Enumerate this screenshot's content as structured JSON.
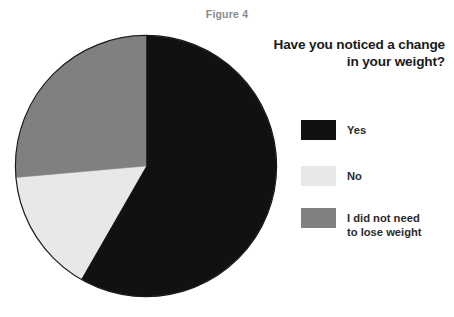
{
  "figure": {
    "caption": "Figure 4"
  },
  "heading": {
    "line1": "Have you noticed a change",
    "line2": "in your weight?"
  },
  "legend": {
    "items": [
      {
        "label": "Yes",
        "color": "#111111"
      },
      {
        "label": "No",
        "color": "#e8e8e8"
      },
      {
        "label": "I did not need\nto lose weight",
        "color": "#808080"
      }
    ]
  },
  "colors": {
    "background": "#ffffff",
    "caption": "#8a8a8a",
    "heading": "#1a1a1a",
    "legend_text": "#2b2b2b",
    "pie_outline": "#1a1a1a",
    "slice_yes": "#111111",
    "slice_no": "#e8e8e8",
    "slice_no_need": "#808080"
  },
  "chart_data": {
    "type": "pie",
    "title": "Have you noticed a change in your weight?",
    "subtitle": "Figure 4",
    "categories": [
      "Yes",
      "No",
      "I did not need to lose weight"
    ],
    "values": [
      58.3,
      15.3,
      26.4
    ],
    "unit": "percent",
    "colors": [
      "#111111",
      "#e8e8e8",
      "#808080"
    ],
    "start_angle_deg": 0,
    "direction": "clockwise",
    "slice_angles_deg": [
      210,
      55,
      95
    ],
    "boundaries_deg": [
      0,
      210,
      265,
      360
    ],
    "legend_position": "right",
    "grid": false,
    "data_labels": false,
    "xlabel": "",
    "ylabel": ""
  }
}
